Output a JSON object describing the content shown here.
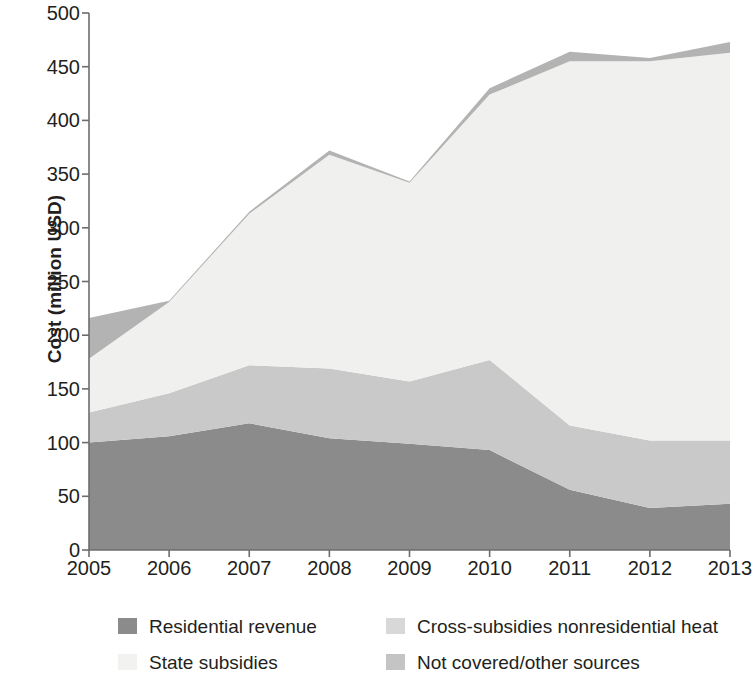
{
  "chart_data": {
    "type": "area",
    "stacked": true,
    "title": "",
    "xlabel": "",
    "ylabel": "Cost (million USD)",
    "categories": [
      "2005",
      "2006",
      "2007",
      "2008",
      "2009",
      "2010",
      "2011",
      "2012",
      "2013"
    ],
    "x": [
      2005,
      2006,
      2007,
      2008,
      2009,
      2010,
      2011,
      2012,
      2013
    ],
    "xlim": [
      2005,
      2013
    ],
    "ylim": [
      0,
      500
    ],
    "yticks": [
      0,
      50,
      100,
      150,
      200,
      250,
      300,
      350,
      400,
      450,
      500
    ],
    "xticks": [
      2005,
      2006,
      2007,
      2008,
      2009,
      2010,
      2011,
      2012,
      2013
    ],
    "grid": false,
    "legend_position": "below",
    "series": [
      {
        "name": "Residential revenue",
        "color": "#8b8b8b",
        "values": [
          100,
          106,
          118,
          104,
          99,
          93,
          56,
          39,
          43
        ]
      },
      {
        "name": "Cross-subsidies nonresidential heat",
        "color": "#c9c9c9",
        "values": [
          28,
          40,
          54,
          65,
          58,
          84,
          60,
          63,
          59
        ]
      },
      {
        "name": "State subsidies",
        "color": "#f0f0ee",
        "values": [
          50,
          85,
          141,
          199,
          185,
          247,
          339,
          353,
          361
        ]
      },
      {
        "name": "Not covered/other sources",
        "color": "#b3b3b3",
        "values": [
          38,
          1,
          2,
          4,
          1,
          6,
          9,
          3,
          10
        ]
      }
    ],
    "cumulative_tops": {
      "Residential revenue": [
        100,
        106,
        118,
        104,
        99,
        93,
        56,
        39,
        43
      ],
      "Cross-subsidies nonresidential heat": [
        128,
        146,
        172,
        169,
        157,
        177,
        116,
        102,
        102
      ],
      "State subsidies": [
        178,
        231,
        313,
        368,
        342,
        424,
        455,
        455,
        463
      ],
      "Not covered/other sources": [
        216,
        232,
        315,
        372,
        343,
        430,
        464,
        458,
        473
      ]
    }
  },
  "axis": {
    "ylabel": "Cost (million USD)",
    "ytick_labels": [
      "500",
      "450",
      "400",
      "350",
      "300",
      "250",
      "200",
      "150",
      "100",
      "50",
      "0"
    ],
    "xtick_labels": [
      "2005",
      "2006",
      "2007",
      "2008",
      "2009",
      "2010",
      "2011",
      "2012",
      "2013"
    ]
  },
  "legend": {
    "items": [
      {
        "label": "Residential revenue",
        "color": "#8b8b8b",
        "swatch": "legend-swatch"
      },
      {
        "label": "Cross-subsidies nonresidential heat",
        "color": "#d8d8d8",
        "swatch": "legend-swatch"
      },
      {
        "label": "State subsidies",
        "color": "#f2f2f0",
        "swatch": "legend-swatch"
      },
      {
        "label": "Not covered/other sources",
        "color": "#c4c4c4",
        "swatch": "legend-swatch"
      }
    ]
  }
}
